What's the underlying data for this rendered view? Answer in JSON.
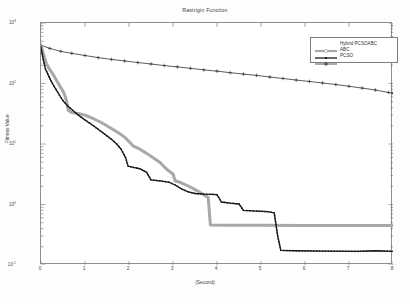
{
  "chart_data": {
    "type": "line",
    "title": "Rastrigin Function",
    "xlabel": "(Second)",
    "ylabel": "Fitness Value",
    "xlim": [
      0,
      8
    ],
    "ylim": [
      0.1,
      1000
    ],
    "yscale": "log",
    "xscale": "linear",
    "grid": false,
    "legend_position": "top-right",
    "xticks": [
      "0",
      "1",
      "2",
      "3",
      "4",
      "5",
      "6",
      "7",
      "8"
    ],
    "yticks": [
      {
        "label": "10",
        "exp": "-1",
        "value": 0.1
      },
      {
        "label": "10",
        "exp": "0",
        "value": 1
      },
      {
        "label": "10",
        "exp": "1",
        "value": 10
      },
      {
        "label": "10",
        "exp": "2",
        "value": 100
      },
      {
        "label": "10",
        "exp": "3",
        "value": 1000
      }
    ],
    "series": [
      {
        "name": "Hybrid PCSOABC",
        "color": "#a8a8a8",
        "linewidth": 3.0,
        "marker": "circle",
        "points": [
          [
            0.0,
            420
          ],
          [
            0.06,
            300
          ],
          [
            0.12,
            215
          ],
          [
            0.2,
            170
          ],
          [
            0.28,
            140
          ],
          [
            0.36,
            110
          ],
          [
            0.44,
            88
          ],
          [
            0.52,
            70
          ],
          [
            0.58,
            52
          ],
          [
            0.62,
            36
          ],
          [
            0.7,
            33
          ],
          [
            0.85,
            32
          ],
          [
            1.0,
            30
          ],
          [
            1.15,
            27
          ],
          [
            1.3,
            24
          ],
          [
            1.45,
            21
          ],
          [
            1.6,
            18
          ],
          [
            1.75,
            15.5
          ],
          [
            1.9,
            13
          ],
          [
            2.0,
            11
          ],
          [
            2.1,
            9.2
          ],
          [
            2.25,
            8.2
          ],
          [
            2.4,
            7.0
          ],
          [
            2.55,
            5.9
          ],
          [
            2.7,
            5.0
          ],
          [
            2.8,
            4.2
          ],
          [
            2.9,
            3.6
          ],
          [
            3.0,
            3.2
          ],
          [
            3.05,
            2.45
          ],
          [
            3.15,
            2.35
          ],
          [
            3.3,
            2.1
          ],
          [
            3.45,
            1.85
          ],
          [
            3.6,
            1.6
          ],
          [
            3.72,
            1.42
          ],
          [
            3.8,
            1.3
          ],
          [
            3.85,
            0.46
          ],
          [
            4.2,
            0.455
          ],
          [
            5.0,
            0.452
          ],
          [
            6.0,
            0.45
          ],
          [
            7.0,
            0.45
          ],
          [
            8.0,
            0.45
          ]
        ]
      },
      {
        "name": "ABC",
        "color": "#1a1a1a",
        "linewidth": 1.3,
        "marker": "dot",
        "points": [
          [
            0.0,
            400
          ],
          [
            0.05,
            250
          ],
          [
            0.1,
            175
          ],
          [
            0.18,
            130
          ],
          [
            0.26,
            100
          ],
          [
            0.34,
            80
          ],
          [
            0.42,
            64
          ],
          [
            0.5,
            52
          ],
          [
            0.6,
            43
          ],
          [
            0.72,
            36
          ],
          [
            0.85,
            30
          ],
          [
            1.0,
            25
          ],
          [
            1.15,
            21
          ],
          [
            1.3,
            17.5
          ],
          [
            1.45,
            14.5
          ],
          [
            1.6,
            12
          ],
          [
            1.72,
            10
          ],
          [
            1.82,
            8.2
          ],
          [
            1.92,
            6.0
          ],
          [
            1.98,
            4.3
          ],
          [
            2.1,
            4.1
          ],
          [
            2.25,
            3.9
          ],
          [
            2.4,
            3.4
          ],
          [
            2.5,
            2.55
          ],
          [
            2.7,
            2.45
          ],
          [
            2.9,
            2.35
          ],
          [
            3.05,
            2.1
          ],
          [
            3.2,
            1.8
          ],
          [
            3.35,
            1.62
          ],
          [
            3.5,
            1.52
          ],
          [
            3.7,
            1.48
          ],
          [
            3.9,
            1.47
          ],
          [
            4.0,
            1.45
          ],
          [
            4.1,
            1.1
          ],
          [
            4.3,
            1.05
          ],
          [
            4.5,
            1.02
          ],
          [
            4.6,
            0.8
          ],
          [
            4.9,
            0.78
          ],
          [
            5.15,
            0.76
          ],
          [
            5.3,
            0.73
          ],
          [
            5.38,
            0.3
          ],
          [
            5.45,
            0.175
          ],
          [
            5.8,
            0.172
          ],
          [
            6.4,
            0.17
          ],
          [
            7.2,
            0.168
          ],
          [
            7.6,
            0.172
          ],
          [
            8.0,
            0.168
          ]
        ]
      },
      {
        "name": "PCSO",
        "color": "#333333",
        "linewidth": 0.8,
        "marker": "plus",
        "points": [
          [
            0.0,
            430
          ],
          [
            0.2,
            380
          ],
          [
            0.45,
            340
          ],
          [
            0.7,
            315
          ],
          [
            1.0,
            290
          ],
          [
            1.3,
            268
          ],
          [
            1.6,
            250
          ],
          [
            1.9,
            236
          ],
          [
            2.2,
            222
          ],
          [
            2.5,
            210
          ],
          [
            2.8,
            198
          ],
          [
            3.1,
            188
          ],
          [
            3.4,
            178
          ],
          [
            3.7,
            168
          ],
          [
            4.0,
            160
          ],
          [
            4.3,
            151
          ],
          [
            4.6,
            143
          ],
          [
            4.9,
            136
          ],
          [
            5.2,
            128
          ],
          [
            5.5,
            121
          ],
          [
            5.8,
            114
          ],
          [
            6.1,
            108
          ],
          [
            6.4,
            102
          ],
          [
            6.7,
            96
          ],
          [
            7.0,
            90
          ],
          [
            7.3,
            84
          ],
          [
            7.6,
            78
          ],
          [
            7.9,
            71
          ],
          [
            8.0,
            69
          ]
        ]
      }
    ]
  }
}
